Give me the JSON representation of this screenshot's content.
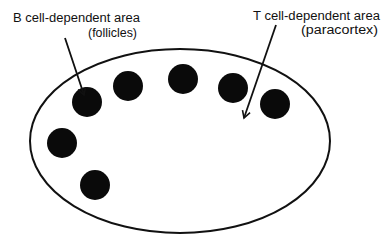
{
  "diagram": {
    "type": "lymph-node-schematic",
    "background_color": "#ffffff",
    "stroke_color": "#111111",
    "labels": {
      "b_cell": {
        "line1": "B cell-dependent area",
        "line2": "(follicles)"
      },
      "t_cell": {
        "line1": "T cell-dependent area",
        "line2": "(paracortex)"
      }
    },
    "node_outline": {
      "shape": "ellipse",
      "cx": 180,
      "cy": 141,
      "rx": 150,
      "ry": 92
    },
    "follicles": [
      {
        "cx": 87,
        "cy": 102,
        "r": 15
      },
      {
        "cx": 128,
        "cy": 86,
        "r": 15
      },
      {
        "cx": 183,
        "cy": 79,
        "r": 15
      },
      {
        "cx": 233,
        "cy": 88,
        "r": 15
      },
      {
        "cx": 275,
        "cy": 104,
        "r": 15
      },
      {
        "cx": 62,
        "cy": 143,
        "r": 15
      },
      {
        "cx": 95,
        "cy": 185,
        "r": 15
      }
    ],
    "arrows": [
      {
        "name": "b-cell-arrow",
        "x1": 65,
        "y1": 38,
        "x2": 84,
        "y2": 95
      },
      {
        "name": "t-cell-arrow",
        "x1": 276,
        "y1": 25,
        "x2": 244,
        "y2": 118
      }
    ]
  }
}
